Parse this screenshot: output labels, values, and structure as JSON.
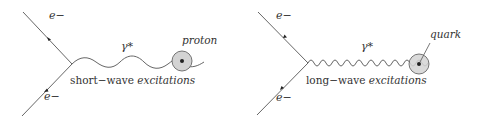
{
  "diagrams": [
    {
      "name": "short-wave",
      "electron_top_label": "e−",
      "electron_bottom_label": "e−",
      "photon_label": "γ*",
      "target_label": "proton",
      "caption_plain": "short−wave ",
      "caption_italic": "excitations"
    },
    {
      "name": "long-wave",
      "electron_top_label": "e−",
      "electron_bottom_label": "e−",
      "photon_label": "γ*",
      "target_label": "quark",
      "caption_plain": "long−wave ",
      "caption_italic": "excitations"
    }
  ],
  "colors": {
    "line": "#555555",
    "blob_fill": "#d3d3d3",
    "blob_stroke": "#666666",
    "dot": "#222222",
    "text": "#333333"
  }
}
